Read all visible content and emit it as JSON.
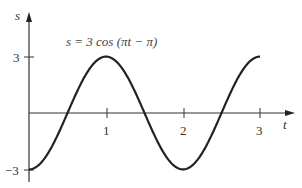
{
  "chart_data": {
    "type": "line",
    "title": "s = 3 cos (πt − π)",
    "xlabel": "t",
    "ylabel": "s",
    "x_ticks": [
      "1",
      "2",
      "3"
    ],
    "y_ticks": [
      "3",
      "−3"
    ],
    "xlim": [
      0,
      3
    ],
    "ylim": [
      -3,
      3
    ],
    "grid": false,
    "legend": null,
    "series": [
      {
        "name": "s = 3 cos (πt − π)",
        "x": [
          0,
          0.25,
          0.5,
          0.75,
          1.0,
          1.25,
          1.5,
          1.75,
          2.0,
          2.25,
          2.5,
          2.75,
          3.0
        ],
        "y": [
          -3,
          -2.12,
          0,
          2.12,
          3,
          2.12,
          0,
          -2.12,
          -3,
          -2.12,
          0,
          2.12,
          3
        ]
      }
    ],
    "annotations": [
      {
        "text": "s = 3 cos (πt − π)",
        "position": "above curve near t≈0.5–1.5"
      }
    ]
  },
  "labels": {
    "y_axis": "s",
    "x_axis": "t",
    "tick_1": "1",
    "tick_2": "2",
    "tick_3": "3",
    "y_tick_pos": "3",
    "y_tick_neg": "−3",
    "equation": "s = 3 cos (πt − π)"
  },
  "colors": {
    "axis": "#333333",
    "curve": "#222222"
  }
}
